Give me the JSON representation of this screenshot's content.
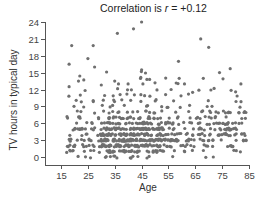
{
  "chart_data": {
    "type": "scatter",
    "title_prefix": "Correlation is ",
    "title_var": "r",
    "title_suffix": " = +0.12",
    "title": "Correlation is r = +0.12",
    "xlabel": "Age",
    "ylabel": "TV hours in typical day",
    "xlim": [
      12,
      86
    ],
    "ylim": [
      -1,
      24
    ],
    "xticks": [
      15,
      25,
      35,
      45,
      55,
      65,
      75,
      85
    ],
    "yticks": [
      0,
      3,
      6,
      9,
      12,
      15,
      18,
      21,
      24
    ],
    "grid": false,
    "legend": null,
    "point_color": "#6f6f6f",
    "correlation_r": 0.12,
    "outliers": [
      {
        "x": 19,
        "y": 19.8
      },
      {
        "x": 27,
        "y": 19.8
      },
      {
        "x": 25,
        "y": 17.5
      },
      {
        "x": 18,
        "y": 16.5
      },
      {
        "x": 27.5,
        "y": 16
      },
      {
        "x": 36,
        "y": 22
      },
      {
        "x": 42,
        "y": 22.8
      },
      {
        "x": 45,
        "y": 24
      },
      {
        "x": 45,
        "y": 15.5
      },
      {
        "x": 22,
        "y": 14.4
      },
      {
        "x": 21.5,
        "y": 13.5
      },
      {
        "x": 23.5,
        "y": 13.7
      },
      {
        "x": 67,
        "y": 21
      },
      {
        "x": 70,
        "y": 19.5
      },
      {
        "x": 74,
        "y": 15
      },
      {
        "x": 78,
        "y": 15.7
      },
      {
        "x": 68,
        "y": 14
      },
      {
        "x": 59,
        "y": 14
      },
      {
        "x": 61,
        "y": 13
      },
      {
        "x": 45.5,
        "y": 13
      },
      {
        "x": 47,
        "y": 13.8
      },
      {
        "x": 48,
        "y": 13.8
      },
      {
        "x": 50,
        "y": 13.2
      },
      {
        "x": 35,
        "y": 13.5
      },
      {
        "x": 40,
        "y": 13
      },
      {
        "x": 30,
        "y": 12.8
      },
      {
        "x": 82,
        "y": 13
      },
      {
        "x": 18,
        "y": 12.5
      },
      {
        "x": 56,
        "y": 12
      },
      {
        "x": 64,
        "y": 11.5
      },
      {
        "x": 72,
        "y": 12.2
      },
      {
        "x": 80,
        "y": 11.6
      }
    ],
    "dense_cloud": {
      "n": 700,
      "x_range": [
        17,
        84
      ],
      "y_mode": 3.5,
      "y_spread": 2.4,
      "y_min": 0,
      "slope_per_year": 0.02,
      "seed": 12345
    }
  }
}
